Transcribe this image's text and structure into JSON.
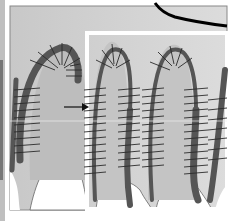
{
  "figure": {
    "colors": {
      "background": "#ffffff",
      "panel_fill": "#cfcfcf",
      "light_fill": "#bdbdbd",
      "boundary_band": "#555555",
      "hatch": "#2a2a2a",
      "inset_frame": "#ffffff",
      "top_curve": "#000000",
      "frame": "#777777"
    },
    "annotations": {
      "arrow": "arrow-pointing-right",
      "inset": "white-rectangle-inset",
      "curve": "black-boundary-curve"
    }
  }
}
